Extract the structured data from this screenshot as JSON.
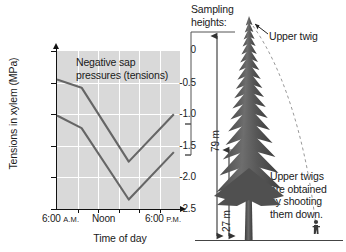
{
  "figure": {
    "chart": {
      "y_axis_title": "Tensions in xylem (MPa)",
      "x_axis_title": "Time of day",
      "annotation_line1": "Negative sap",
      "annotation_line2": "pressures (tensions)",
      "y_ticks": [
        "0",
        "-0.5",
        "-1.0",
        "-1.5",
        "-2.0",
        "-2.5"
      ],
      "x_ticks": [
        {
          "label": "6:00",
          "suffix": "A.M."
        },
        {
          "label": "Noon",
          "suffix": ""
        },
        {
          "label": "6:00",
          "suffix": "P.M."
        }
      ],
      "plot_background": "#d9d9d9",
      "gridline_color": "#ffffff",
      "series_color": "#666666"
    },
    "tree": {
      "sampling_label_line1": "Sampling",
      "sampling_label_line2": "heights:",
      "upper_twig_label": "Upper twig",
      "note_line1": "Upper twigs",
      "note_line2": "are obtained",
      "note_line3": "by shooting",
      "note_line4": "them down.",
      "height_upper": "79 m",
      "height_lower": "27 m",
      "foliage_color": "#5a5a5a",
      "trunk_color": "#4a4a4a"
    }
  },
  "chart_data": {
    "type": "line",
    "title": "Negative sap pressures (tensions)",
    "xlabel": "Time of day",
    "ylabel": "Tensions in xylem (MPa)",
    "xlim": [
      6,
      18
    ],
    "ylim": [
      -2.5,
      0
    ],
    "ytick_values": [
      0,
      -0.5,
      -1.0,
      -1.5,
      -2.0,
      -2.5
    ],
    "xtick_values": [
      6,
      12,
      18
    ],
    "xtick_labels": [
      "6:00 A.M.",
      "Noon",
      "6:00 P.M."
    ],
    "grid": true,
    "legend": false,
    "series": [
      {
        "name": "27 m (lower branches)",
        "height_m": 27,
        "x": [
          6,
          8.4,
          13.0,
          17.4
        ],
        "values": [
          -0.45,
          -0.58,
          -1.75,
          -1.0
        ]
      },
      {
        "name": "79 m (upper twig)",
        "height_m": 79,
        "x": [
          6,
          8.4,
          13.0,
          17.4
        ],
        "values": [
          -1.02,
          -1.22,
          -2.35,
          -1.6
        ]
      }
    ]
  }
}
